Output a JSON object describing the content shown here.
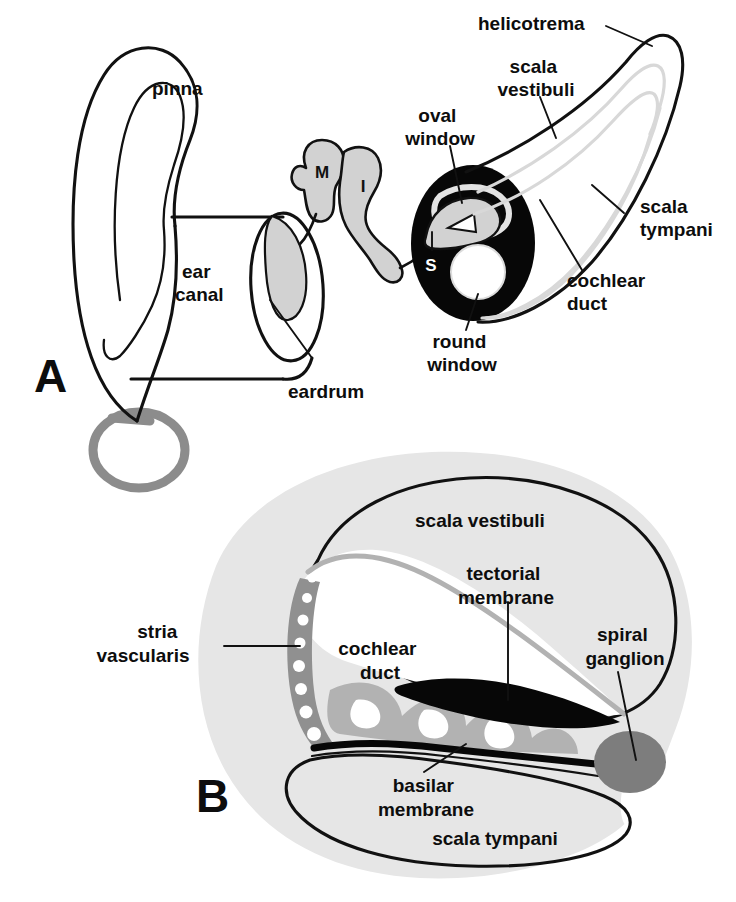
{
  "figure": {
    "panels": [
      {
        "id": "A",
        "letter": "A",
        "caption": "Outer, middle and uncoiled inner ear"
      },
      {
        "id": "B",
        "letter": "B",
        "caption": "Cross-section through one turn of the cochlea"
      }
    ]
  },
  "colors": {
    "ink": "#111111",
    "paper": "#ffffff",
    "ossicle_gray": "#d2d2d2",
    "cochlea_black": "#070707",
    "eustachian_gray": "#8c8c8c",
    "bone_capsule_gray": "#e6e6e6",
    "organ_of_corti_gray": "#b2b2b2",
    "stria_gray": "#909090",
    "ganglion_gray": "#7d7d7d",
    "duct_line_gray": "#d8d8d8"
  },
  "panel_a": {
    "letter": "A",
    "labels": [
      {
        "id": "pinna",
        "text": "pinna",
        "lines": [
          "pinna"
        ],
        "x": 152,
        "y": 95
      },
      {
        "id": "ear-canal",
        "text": "ear canal",
        "lines": [
          "ear",
          "canal"
        ],
        "x": 182,
        "y": 278
      },
      {
        "id": "eardrum",
        "text": "eardrum",
        "lines": [
          "eardrum"
        ],
        "x": 292,
        "y": 393
      },
      {
        "id": "oval-window",
        "text": "oval window",
        "lines": [
          "oval",
          "window"
        ],
        "x": 408,
        "y": 122
      },
      {
        "id": "round-window",
        "text": "round window",
        "lines": [
          "round",
          "window"
        ],
        "x": 419,
        "y": 345
      },
      {
        "id": "helicotrema",
        "text": "helicotrema",
        "lines": [
          "helicotrema"
        ],
        "x": 478,
        "y": 30
      },
      {
        "id": "scala-vestibuli",
        "text": "scala vestibuli",
        "lines": [
          "scala",
          "vestibuli"
        ],
        "x": 489,
        "y": 73
      },
      {
        "id": "scala-tympani",
        "text": "scala tympani",
        "lines": [
          "scala",
          "tympani"
        ],
        "x": 640,
        "y": 213
      },
      {
        "id": "cochlear-duct",
        "text": "cochlear duct",
        "lines": [
          "cochlear",
          "duct"
        ],
        "x": 567,
        "y": 287
      }
    ],
    "ossicles": [
      {
        "id": "malleus",
        "letter": "M",
        "name": "malleus",
        "x": 322,
        "y": 172
      },
      {
        "id": "incus",
        "letter": "I",
        "name": "incus",
        "x": 363,
        "y": 186
      },
      {
        "id": "stapes",
        "letter": "S",
        "name": "stapes",
        "x": 431,
        "y": 265
      }
    ]
  },
  "panel_b": {
    "letter": "B",
    "labels": [
      {
        "id": "scala-vestibuli-b",
        "text": "scala vestibuli",
        "lines": [
          "scala vestibuli"
        ],
        "x": 415,
        "y": 520
      },
      {
        "id": "tectorial-membrane",
        "text": "tectorial membrane",
        "lines": [
          "tectorial",
          "membrane"
        ],
        "x": 500,
        "y": 580
      },
      {
        "id": "spiral-ganglion",
        "text": "spiral ganglion",
        "lines": [
          "spiral",
          "ganglion"
        ],
        "x": 612,
        "y": 641
      },
      {
        "id": "stria-vascularis",
        "text": "stria vascularis",
        "lines": [
          "stria",
          "vascularis"
        ],
        "x": 187,
        "y": 638
      },
      {
        "id": "cochlear-duct-b",
        "text": "cochlear duct",
        "lines": [
          "cochlear",
          "duct"
        ],
        "x": 362,
        "y": 655
      },
      {
        "id": "basilar-membrane",
        "text": "basilar membrane",
        "lines": [
          "basilar",
          "membrane"
        ],
        "x": 426,
        "y": 792
      },
      {
        "id": "scala-tympani-b",
        "text": "scala tympani",
        "lines": [
          "scala tympani"
        ],
        "x": 495,
        "y": 840
      }
    ]
  }
}
